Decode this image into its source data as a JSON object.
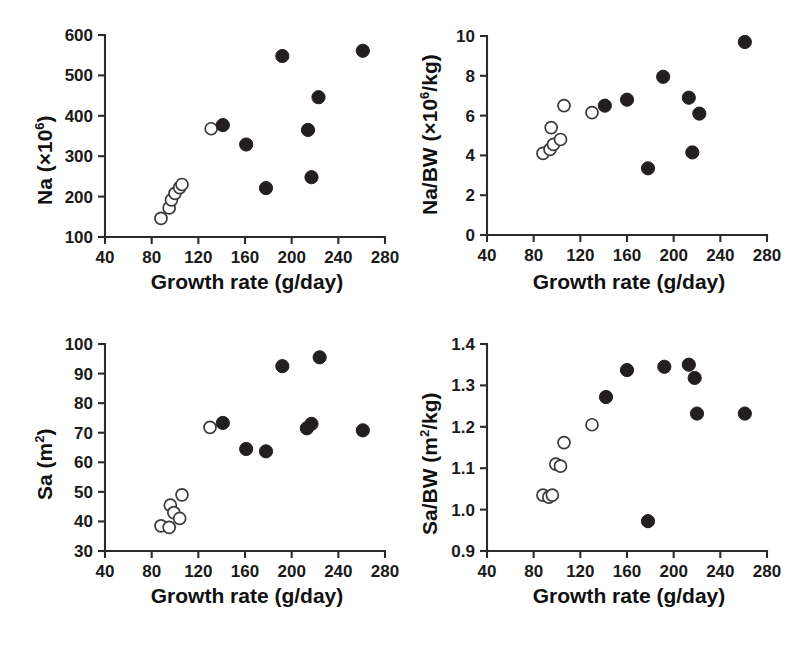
{
  "figure": {
    "panel_count": 4,
    "marker_legend": {
      "open_circle": "open-circle-group",
      "closed_circle": "filled-circle-group"
    }
  },
  "chart_data": [
    {
      "id": "na-panel",
      "type": "scatter",
      "title": "",
      "xlabel": "Growth rate (g/day)",
      "ylabel_main": "Na (",
      "ylabel_prefix": "×10",
      "ylabel_exponent": "6",
      "ylabel_suffix": ")",
      "ylabel_plain": "Na (×10⁶)",
      "xlim": [
        40,
        280
      ],
      "ylim": [
        100,
        600
      ],
      "xticks": [
        40,
        80,
        120,
        160,
        200,
        240,
        280
      ],
      "yticks": [
        100,
        200,
        300,
        400,
        500,
        600
      ],
      "xticklabels": [
        "40",
        "80",
        "120",
        "160",
        "200",
        "240",
        "280"
      ],
      "yticklabels": [
        "100",
        "200",
        "300",
        "400",
        "500",
        "600"
      ],
      "grid": false,
      "legend": "none",
      "series": [
        {
          "name": "open-circle-group",
          "marker": "open",
          "points": [
            [
              88,
              146
            ],
            [
              95,
              172
            ],
            [
              97,
              192
            ],
            [
              100,
              208
            ],
            [
              104,
              222
            ],
            [
              106,
              230
            ],
            [
              131,
              368
            ]
          ]
        },
        {
          "name": "filled-circle-group",
          "marker": "closed",
          "points": [
            [
              141,
              377
            ],
            [
              161,
              329
            ],
            [
              178,
              221
            ],
            [
              192,
              548
            ],
            [
              214,
              365
            ],
            [
              217,
              248
            ],
            [
              223,
              446
            ],
            [
              261,
              561
            ]
          ]
        }
      ]
    },
    {
      "id": "na-bw-panel",
      "type": "scatter",
      "title": "",
      "xlabel": "Growth rate (g/day)",
      "ylabel_main": "Na/BW (",
      "ylabel_prefix": "×10",
      "ylabel_exponent": "6",
      "ylabel_suffix": "/kg)",
      "ylabel_plain": "Na/BW (×10⁶/kg)",
      "xlim": [
        40,
        280
      ],
      "ylim": [
        0,
        10
      ],
      "xticks": [
        40,
        80,
        120,
        160,
        200,
        240,
        280
      ],
      "yticks": [
        0,
        2,
        4,
        6,
        8,
        10
      ],
      "xticklabels": [
        "40",
        "80",
        "120",
        "160",
        "200",
        "240",
        "280"
      ],
      "yticklabels": [
        "0",
        "2",
        "4",
        "6",
        "8",
        "10"
      ],
      "grid": false,
      "legend": "none",
      "series": [
        {
          "name": "open-circle-group",
          "marker": "open",
          "points": [
            [
              88,
              4.1
            ],
            [
              94,
              4.3
            ],
            [
              95,
              5.4
            ],
            [
              97,
              4.55
            ],
            [
              103,
              4.8
            ],
            [
              106,
              6.5
            ],
            [
              130,
              6.15
            ]
          ]
        },
        {
          "name": "filled-circle-group",
          "marker": "closed",
          "points": [
            [
              141,
              6.5
            ],
            [
              160,
              6.8
            ],
            [
              178,
              3.35
            ],
            [
              191,
              7.95
            ],
            [
              213,
              6.9
            ],
            [
              216,
              4.15
            ],
            [
              222,
              6.1
            ],
            [
              261,
              9.7
            ]
          ]
        }
      ]
    },
    {
      "id": "sa-panel",
      "type": "scatter",
      "title": "",
      "xlabel": "Growth rate (g/day)",
      "ylabel_main": "Sa (m",
      "ylabel_prefix": "",
      "ylabel_exponent": "2",
      "ylabel_suffix": ")",
      "ylabel_plain": "Sa (m²)",
      "xlim": [
        40,
        280
      ],
      "ylim": [
        30,
        100
      ],
      "xticks": [
        40,
        80,
        120,
        160,
        200,
        240,
        280
      ],
      "yticks": [
        30,
        40,
        50,
        60,
        70,
        80,
        90,
        100
      ],
      "xticklabels": [
        "40",
        "80",
        "120",
        "160",
        "200",
        "240",
        "280"
      ],
      "yticklabels": [
        "30",
        "40",
        "50",
        "60",
        "70",
        "80",
        "90",
        "100"
      ],
      "grid": false,
      "legend": "none",
      "series": [
        {
          "name": "open-circle-group",
          "marker": "open",
          "points": [
            [
              88,
              38.5
            ],
            [
              95,
              38.0
            ],
            [
              96,
              45.5
            ],
            [
              99,
              43.0
            ],
            [
              104,
              41.0
            ],
            [
              106,
              49.0
            ],
            [
              130,
              71.8
            ]
          ]
        },
        {
          "name": "filled-circle-group",
          "marker": "closed",
          "points": [
            [
              141,
              73.3
            ],
            [
              161,
              64.5
            ],
            [
              178,
              63.7
            ],
            [
              192,
              92.5
            ],
            [
              213,
              71.5
            ],
            [
              217,
              73.0
            ],
            [
              224,
              95.5
            ],
            [
              261,
              70.8
            ]
          ]
        }
      ]
    },
    {
      "id": "sa-bw-panel",
      "type": "scatter",
      "title": "",
      "xlabel": "Growth rate (g/day)",
      "ylabel_main": "Sa/BW (m",
      "ylabel_prefix": "",
      "ylabel_exponent": "2",
      "ylabel_suffix": "/kg)",
      "ylabel_plain": "Sa/BW (m²/kg)",
      "xlim": [
        40,
        280
      ],
      "ylim": [
        0.9,
        1.4
      ],
      "xticks": [
        40,
        80,
        120,
        160,
        200,
        240,
        280
      ],
      "yticks": [
        0.9,
        1.0,
        1.1,
        1.2,
        1.3,
        1.4
      ],
      "xticklabels": [
        "40",
        "80",
        "120",
        "160",
        "200",
        "240",
        "280"
      ],
      "yticklabels": [
        "0.9",
        "1.0",
        "1.1",
        "1.2",
        "1.3",
        "1.4"
      ],
      "grid": false,
      "legend": "none",
      "series": [
        {
          "name": "open-circle-group",
          "marker": "open",
          "points": [
            [
              88,
              1.035
            ],
            [
              93,
              1.03
            ],
            [
              96,
              1.035
            ],
            [
              99,
              1.11
            ],
            [
              103,
              1.105
            ],
            [
              106,
              1.162
            ],
            [
              130,
              1.205
            ]
          ]
        },
        {
          "name": "filled-circle-group",
          "marker": "closed",
          "points": [
            [
              142,
              1.272
            ],
            [
              160,
              1.337
            ],
            [
              178,
              0.972
            ],
            [
              192,
              1.345
            ],
            [
              213,
              1.35
            ],
            [
              218,
              1.318
            ],
            [
              220,
              1.232
            ],
            [
              261,
              1.232
            ]
          ]
        }
      ]
    }
  ]
}
